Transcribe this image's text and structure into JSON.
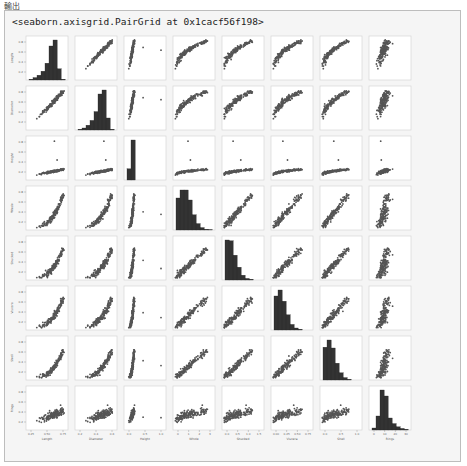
{
  "output_label": "輸出",
  "repr_text": "<seaborn.axisgrid.PairGrid at 0x1cacf56f198>",
  "chart_data": {
    "type": "pairplot",
    "title": "",
    "variables": [
      "Length",
      "Diameter",
      "Height",
      "Whole",
      "Shucked",
      "Viscera",
      "Shell",
      "Rings"
    ],
    "ranges": [
      [
        0.05,
        0.85
      ],
      [
        0.05,
        0.68
      ],
      [
        0.0,
        1.15
      ],
      [
        0.0,
        3.0
      ],
      [
        0.0,
        1.55
      ],
      [
        0.0,
        0.8
      ],
      [
        0.0,
        1.05
      ],
      [
        0,
        30
      ]
    ],
    "x_ticks": [
      [
        "0.25",
        "0.50",
        "0.75"
      ],
      [
        "0.2",
        "0.4",
        "0.6"
      ],
      [
        "0.0",
        "0.5",
        "1.0"
      ],
      [
        "0",
        "1",
        "2",
        "3"
      ],
      [
        "0.0",
        "0.5",
        "1.0",
        "1.5"
      ],
      [
        "0.00",
        "0.25",
        "0.50",
        "0.75"
      ],
      [
        "0.0",
        "0.5",
        "1.0"
      ],
      [
        "0",
        "10",
        "20",
        "30"
      ]
    ],
    "histograms": [
      [
        0.02,
        0.06,
        0.12,
        0.22,
        0.42,
        0.85,
        1.0,
        0.28,
        0.02
      ],
      [
        0.02,
        0.05,
        0.12,
        0.24,
        0.46,
        0.9,
        1.0,
        0.3,
        0.02
      ],
      [
        0.28,
        1.0,
        0.0,
        0.0,
        0.0,
        0.0,
        0.0,
        0.0,
        0.0
      ],
      [
        0.8,
        1.0,
        1.0,
        0.75,
        0.38,
        0.16,
        0.06,
        0.02,
        0.01
      ],
      [
        1.0,
        0.98,
        0.62,
        0.32,
        0.12,
        0.04,
        0.02,
        0.0,
        0.0
      ],
      [
        0.85,
        1.0,
        0.72,
        0.38,
        0.14,
        0.05,
        0.02,
        0.0,
        0.0
      ],
      [
        0.82,
        1.0,
        0.8,
        0.42,
        0.18,
        0.06,
        0.02,
        0.0,
        0.0
      ],
      [
        0.05,
        0.35,
        1.0,
        0.85,
        0.3,
        0.16,
        0.08,
        0.04,
        0.02
      ]
    ],
    "hist_color": "#333333",
    "point_color": "#555555",
    "n_points": 160,
    "grid": false,
    "legend": "none"
  }
}
